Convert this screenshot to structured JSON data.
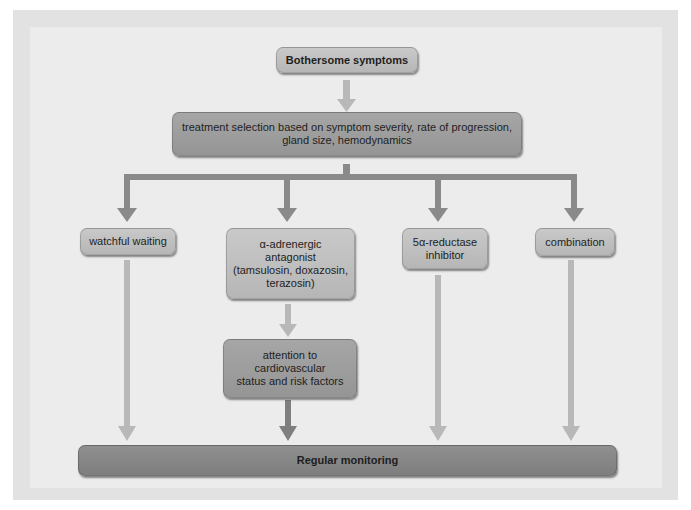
{
  "diagram": {
    "type": "flowchart",
    "nodes": {
      "start": {
        "label": "Bothersome symptoms"
      },
      "selection": {
        "label": "treatment selection based on symptom severity, rate of progression, gland size, hemodynamics",
        "line1": "treatment selection based on symptom severity, rate of progression,",
        "line2": "gland size, hemodynamics"
      },
      "watchful": {
        "label": "watchful waiting"
      },
      "alpha": {
        "label": "α-adrenergic antagonist (tamsulosin, doxazosin, terazosin)",
        "line1": "α-adrenergic",
        "line2": "antagonist",
        "line3": "(tamsulosin, doxazosin,",
        "line4": "terazosin)"
      },
      "reductase": {
        "label": "5α-reductase inhibitor",
        "line1": "5α-reductase",
        "line2": "inhibitor"
      },
      "combination": {
        "label": "combination"
      },
      "cardio": {
        "label": "attention to cardiovascular status and risk factors",
        "line1": "attention to",
        "line2": "cardiovascular",
        "line3": "status and risk factors"
      },
      "monitoring": {
        "label": "Regular monitoring"
      }
    },
    "edges": [
      {
        "from": "Bothersome symptoms",
        "to": "treatment selection"
      },
      {
        "from": "treatment selection",
        "to": "watchful waiting"
      },
      {
        "from": "treatment selection",
        "to": "α-adrenergic antagonist"
      },
      {
        "from": "treatment selection",
        "to": "5α-reductase inhibitor"
      },
      {
        "from": "treatment selection",
        "to": "combination"
      },
      {
        "from": "α-adrenergic antagonist",
        "to": "attention to cardiovascular status and risk factors"
      },
      {
        "from": "watchful waiting",
        "to": "Regular monitoring"
      },
      {
        "from": "attention to cardiovascular status and risk factors",
        "to": "Regular monitoring"
      },
      {
        "from": "5α-reductase inhibitor",
        "to": "Regular monitoring"
      },
      {
        "from": "combination",
        "to": "Regular monitoring"
      }
    ],
    "colors": {
      "background_frame": "#e2e2e2",
      "background_inner": "#ececec",
      "node_light": "#bfbfbf",
      "node_mid": "#9e9e9e",
      "node_dark": "#878787",
      "arrow_light": "#b3b3b3",
      "arrow_dark": "#7f7f7f"
    }
  }
}
